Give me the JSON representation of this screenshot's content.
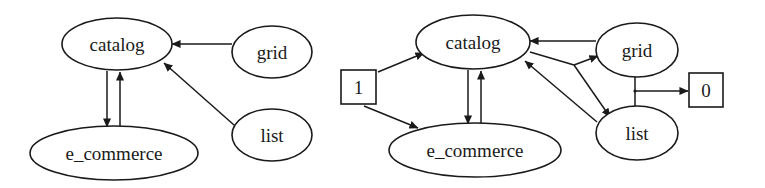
{
  "diagrams": [
    {
      "id": "left",
      "nodes": {
        "catalog": {
          "label": "catalog"
        },
        "grid": {
          "label": "grid"
        },
        "list": {
          "label": "list"
        },
        "e_commerce": {
          "label": "e_commerce"
        }
      },
      "edges": [
        {
          "from": "grid",
          "to": "catalog"
        },
        {
          "from": "list",
          "to": "catalog"
        },
        {
          "from": "catalog",
          "to": "e_commerce"
        },
        {
          "from": "e_commerce",
          "to": "catalog"
        }
      ]
    },
    {
      "id": "right",
      "nodes": {
        "catalog": {
          "label": "catalog"
        },
        "grid": {
          "label": "grid"
        },
        "list": {
          "label": "list"
        },
        "e_commerce": {
          "label": "e_commerce"
        },
        "box_1": {
          "label": "1"
        },
        "box_0": {
          "label": "0"
        }
      },
      "edges": [
        {
          "from": "1",
          "to": "catalog"
        },
        {
          "from": "1",
          "to": "e_commerce"
        },
        {
          "from": "catalog",
          "to": "e_commerce"
        },
        {
          "from": "e_commerce",
          "to": "catalog"
        },
        {
          "from": "grid",
          "to": "catalog"
        },
        {
          "from": "list",
          "to": "catalog"
        },
        {
          "from": "catalog",
          "to": "grid"
        },
        {
          "from": "catalog",
          "to": "list"
        },
        {
          "from": "grid+list junction",
          "to": "0"
        }
      ]
    }
  ]
}
